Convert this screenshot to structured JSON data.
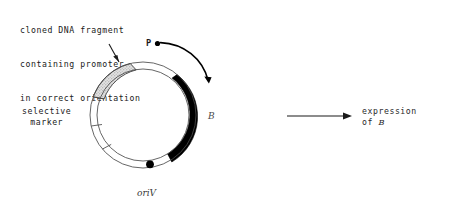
{
  "caption": {
    "line1": "cloned DNA fragment",
    "line2": "containing promoter",
    "line3": "in correct orientation"
  },
  "plasmid": {
    "labels": {
      "promoter": "P",
      "gene": "B",
      "origin": "oriV",
      "selective_marker_line1": "selective",
      "selective_marker_line2": "marker"
    },
    "geometry": {
      "center_x": 143,
      "center_y": 115,
      "outer_radius": 53,
      "inner_radius": 46
    },
    "segments": [
      {
        "name": "cloned-dna-fragment",
        "fill": "stippled-gray",
        "start_deg": 200,
        "end_deg": 256,
        "color": "#d8d8d8"
      },
      {
        "name": "gene-b",
        "fill": "solid-black",
        "start_deg": 290,
        "end_deg": 28,
        "color": "#000000"
      },
      {
        "name": "selective-marker",
        "fill": "white",
        "start_deg": 125,
        "end_deg": 200,
        "color": "#ffffff"
      }
    ],
    "origin_marker": {
      "name": "oriV-dot",
      "angle_deg": 82,
      "color": "#000000"
    },
    "transcription_arrow": {
      "name": "transcription-direction",
      "direction": "clockwise",
      "from_deg": 293,
      "to_deg": 340
    }
  },
  "right_panel": {
    "arrow_label": "implies",
    "result_line1": "expression",
    "result_line2_prefix": "of ",
    "result_line2_gene": "B"
  },
  "colors": {
    "ink": "#1a1a1a",
    "stipple": "#d8d8d8",
    "solid": "#000000",
    "background": "#ffffff"
  }
}
